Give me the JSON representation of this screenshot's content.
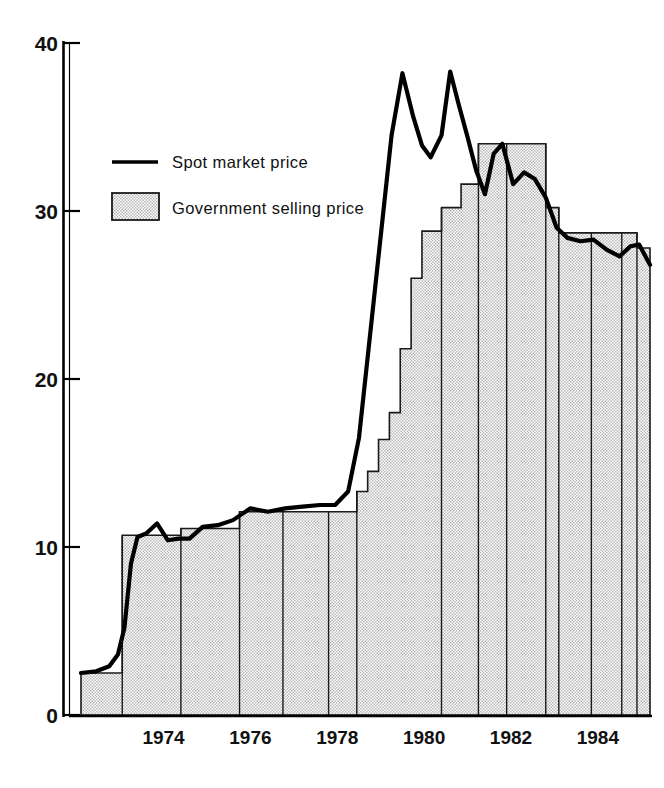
{
  "figure": {
    "title": "",
    "background": "#ffffff",
    "ink_color": "#000000",
    "fill_color": "#d9d9d9"
  },
  "legend": {
    "position": "upper-left-inside",
    "entries": [
      {
        "key": "spot",
        "label": "Spot market price",
        "marker": "line-swatch"
      },
      {
        "key": "government",
        "label": "Government selling price",
        "marker": "filled-rect-swatch"
      }
    ]
  },
  "axes": {
    "y": {
      "ticks": [
        0,
        10,
        20,
        30,
        40
      ],
      "tick_labels": [
        "0",
        "10",
        "20",
        "30",
        "40"
      ],
      "limits": [
        0,
        40
      ],
      "label": ""
    },
    "x": {
      "ticks": [
        1974,
        1976,
        1978,
        1980,
        1982,
        1984
      ],
      "tick_labels": [
        "1974",
        "1976",
        "1978",
        "1980",
        "1982",
        "1984"
      ],
      "limits": [
        1972.6,
        1985.7
      ],
      "label": ""
    }
  },
  "chart_data": {
    "type": "area",
    "title": "",
    "xlabel": "",
    "ylabel": "",
    "xlim": [
      1972.6,
      1985.7
    ],
    "ylim": [
      0,
      40
    ],
    "grid": false,
    "legend_position": "upper-left-inside",
    "series": [
      {
        "name": "Government selling price",
        "type": "step-area",
        "style": "filled",
        "x": [
          1972.6,
          1973.55,
          1973.95,
          1974.9,
          1975.3,
          1976.25,
          1977.25,
          1978.3,
          1978.95,
          1979.2,
          1979.45,
          1979.7,
          1979.95,
          1980.2,
          1980.45,
          1980.9,
          1981.35,
          1982.4,
          1983.3,
          1984.4,
          1985.15,
          1985.7
        ],
        "values": [
          2.5,
          2.5,
          10.7,
          10.7,
          11.1,
          11.1,
          12.1,
          12.1,
          13.3,
          14.5,
          16.4,
          18.0,
          21.8,
          26.0,
          28.8,
          30.2,
          31.6,
          34.0,
          34.0,
          28.7,
          28.7,
          28.7
        ],
        "steps": [
          {
            "from": 1972.6,
            "to": 1973.55,
            "value": 2.5
          },
          {
            "from": 1973.55,
            "to": 1974.9,
            "value": 10.7
          },
          {
            "from": 1974.9,
            "to": 1976.25,
            "value": 11.1
          },
          {
            "from": 1976.25,
            "to": 1978.3,
            "value": 12.1
          },
          {
            "from": 1978.3,
            "to": 1978.95,
            "value": 12.1
          },
          {
            "from": 1978.95,
            "to": 1979.2,
            "value": 13.3
          },
          {
            "from": 1979.2,
            "to": 1979.45,
            "value": 14.5
          },
          {
            "from": 1979.45,
            "to": 1979.7,
            "value": 16.4
          },
          {
            "from": 1979.7,
            "to": 1979.95,
            "value": 18.0
          },
          {
            "from": 1979.95,
            "to": 1980.2,
            "value": 21.8
          },
          {
            "from": 1980.2,
            "to": 1980.45,
            "value": 26.0
          },
          {
            "from": 1980.45,
            "to": 1980.9,
            "value": 28.8
          },
          {
            "from": 1980.9,
            "to": 1981.35,
            "value": 30.2
          },
          {
            "from": 1981.35,
            "to": 1981.75,
            "value": 31.6
          },
          {
            "from": 1981.75,
            "to": 1983.3,
            "value": 34.0
          },
          {
            "from": 1983.3,
            "to": 1983.6,
            "value": 30.2
          },
          {
            "from": 1983.6,
            "to": 1985.05,
            "value": 28.7
          },
          {
            "from": 1985.05,
            "to": 1985.4,
            "value": 28.7
          },
          {
            "from": 1985.4,
            "to": 1985.7,
            "value": 27.8
          }
        ]
      },
      {
        "name": "Spot market price",
        "type": "line",
        "style": "solid-thick",
        "x": [
          1972.6,
          1972.95,
          1973.25,
          1973.45,
          1973.6,
          1973.75,
          1973.9,
          1974.1,
          1974.35,
          1974.6,
          1974.85,
          1975.1,
          1975.4,
          1975.75,
          1976.1,
          1976.5,
          1976.9,
          1977.3,
          1977.7,
          1978.1,
          1978.45,
          1978.75,
          1979.0,
          1979.25,
          1979.5,
          1979.75,
          1980.0,
          1980.25,
          1980.45,
          1980.65,
          1980.9,
          1981.1,
          1981.3,
          1981.5,
          1981.7,
          1981.9,
          1982.1,
          1982.3,
          1982.55,
          1982.8,
          1983.05,
          1983.3,
          1983.55,
          1983.8,
          1984.1,
          1984.4,
          1984.7,
          1985.0,
          1985.25,
          1985.45,
          1985.7
        ],
        "values": [
          2.5,
          2.6,
          2.9,
          3.6,
          5.2,
          9.0,
          10.6,
          10.8,
          11.4,
          10.4,
          10.5,
          10.5,
          11.2,
          11.3,
          11.6,
          12.3,
          12.1,
          12.3,
          12.4,
          12.5,
          12.5,
          13.3,
          16.5,
          22.5,
          28.5,
          34.5,
          38.2,
          35.6,
          33.9,
          33.2,
          34.5,
          38.3,
          36.3,
          34.4,
          32.4,
          31.0,
          33.4,
          34.0,
          31.6,
          32.3,
          31.9,
          30.8,
          29.0,
          28.4,
          28.2,
          28.3,
          27.7,
          27.3,
          27.9,
          28.0,
          26.8
        ]
      }
    ]
  }
}
